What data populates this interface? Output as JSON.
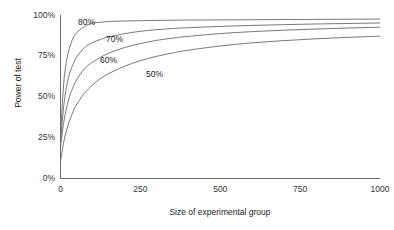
{
  "chart_data": {
    "type": "line",
    "title": "",
    "subtitle": "",
    "xlabel": "Size of experimental group",
    "ylabel": "Power of test",
    "xlim": [
      0,
      1000
    ],
    "ylim": [
      0,
      100
    ],
    "grid": false,
    "legend_position": "inline-curve-labels",
    "xticks": [
      {
        "value": 0,
        "label": "0"
      },
      {
        "value": 250,
        "label": "250"
      },
      {
        "value": 500,
        "label": "500"
      },
      {
        "value": 750,
        "label": "750"
      },
      {
        "value": 1000,
        "label": "1000"
      }
    ],
    "yticks": [
      {
        "value": 0,
        "label": "0%"
      },
      {
        "value": 25,
        "label": "25%"
      },
      {
        "value": 50,
        "label": "50%"
      },
      {
        "value": 75,
        "label": "75%"
      },
      {
        "value": 100,
        "label": "100%"
      }
    ],
    "x": [
      0,
      10,
      20,
      30,
      40,
      50,
      75,
      100,
      125,
      150,
      200,
      250,
      300,
      350,
      400,
      500,
      600,
      700,
      800,
      900,
      1000
    ],
    "series": [
      {
        "name": "80%",
        "label": "80%",
        "annotation": "80%",
        "values": [
          26,
          58,
          73,
          81,
          86,
          89,
          93,
          95,
          95.5,
          96,
          96.3,
          96.5,
          96.7,
          96.8,
          96.9,
          97,
          97.1,
          97.2,
          97.3,
          97.4,
          97.5
        ]
      },
      {
        "name": "70%",
        "label": "70%",
        "annotation": "70%",
        "values": [
          22,
          44,
          57,
          65,
          70,
          74,
          80,
          83,
          85,
          86.5,
          88.5,
          90,
          91,
          91.7,
          92.2,
          93,
          93.6,
          94.1,
          94.5,
          94.8,
          95.1
        ]
      },
      {
        "name": "60%",
        "label": "60%",
        "annotation": "60%",
        "values": [
          19,
          34,
          44,
          51,
          56,
          60,
          67,
          71,
          74,
          76.5,
          80,
          82.5,
          84.4,
          85.8,
          86.9,
          88.6,
          89.8,
          90.7,
          91.4,
          92,
          92.5
        ]
      },
      {
        "name": "50%",
        "label": "50%",
        "annotation": "50%",
        "values": [
          10,
          22,
          30,
          36,
          41,
          45,
          52,
          57,
          61,
          64,
          68.5,
          72,
          74.6,
          76.7,
          78.4,
          81,
          82.9,
          84.3,
          85.4,
          86.3,
          87
        ]
      }
    ],
    "annotations": [
      {
        "text": "80%",
        "x_px": 78,
        "y_px": 18
      },
      {
        "text": "70%",
        "x_px": 106,
        "y_px": 35
      },
      {
        "text": "60%",
        "x_px": 100,
        "y_px": 56
      },
      {
        "text": "50%",
        "x_px": 146,
        "y_px": 70
      }
    ],
    "colors": {
      "curve": "#555555",
      "axis": "#6e6e6e",
      "text": "#222222",
      "background": "#ffffff"
    }
  }
}
